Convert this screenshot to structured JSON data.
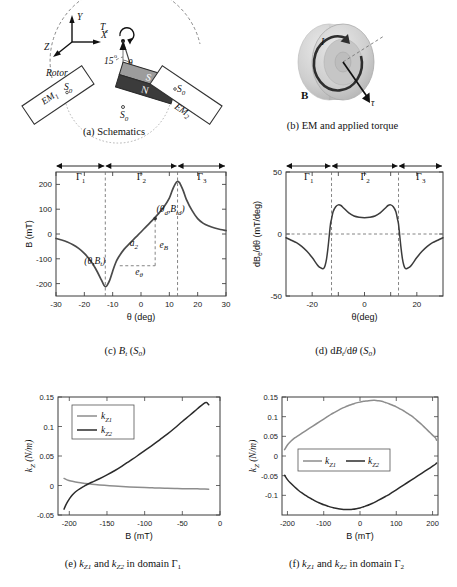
{
  "figure": {
    "panels": [
      {
        "id": "a",
        "caption": "(a) Schematics"
      },
      {
        "id": "b",
        "caption": "(b) EM and applied torque"
      },
      {
        "id": "c",
        "caption_prefix": "(c) ",
        "caption_math": "Bt (S0)"
      },
      {
        "id": "d",
        "caption_prefix": "(d) ",
        "caption_math": "dBt/dθ (S0)"
      },
      {
        "id": "e",
        "caption": "(e) kZ1 and kZ2 in domain Γ1"
      },
      {
        "id": "f",
        "caption": "(f) kZ1 and kZ2 in domain Γ2"
      }
    ]
  },
  "schematic": {
    "axes": {
      "x": "X",
      "y": "Y",
      "z": "Z"
    },
    "torque_label": "Tz",
    "angle_fixed": "15",
    "angle_var": "θ",
    "rotor_label": "Rotor",
    "magnet_pole_top": "S",
    "magnet_pole_bottom": "N",
    "sensor_left": "S0",
    "sensor_right": "S0",
    "sensor_bottom": "S0",
    "em_left": "EM1",
    "em_right": "EM2"
  },
  "em_panel": {
    "current_label": "I",
    "field_label": "B",
    "torque_label": "τ"
  },
  "chart_data": [
    {
      "id": "c",
      "type": "line",
      "title": "",
      "xlabel": "θ (deg)",
      "ylabel": "B (mT)",
      "xlim": [
        -30,
        30
      ],
      "ylim": [
        -250,
        250
      ],
      "xticks": [
        -30,
        -20,
        -10,
        0,
        10,
        20,
        30
      ],
      "yticks": [
        -200,
        -100,
        0,
        100,
        200
      ],
      "grid": false,
      "series": [
        {
          "name": "Bt",
          "x": [
            -30,
            -28,
            -26,
            -24,
            -22,
            -20,
            -18,
            -16,
            -14,
            -13,
            -12.5,
            -12,
            -11,
            -10,
            -9,
            -8,
            -6,
            -4,
            -2,
            0,
            2,
            4,
            6,
            8,
            10,
            11,
            12,
            12.8,
            13.5,
            14,
            15,
            16,
            18,
            20,
            22,
            24,
            26,
            28,
            30
          ],
          "y": [
            -18,
            -24,
            -32,
            -43,
            -58,
            -78,
            -105,
            -140,
            -185,
            -208,
            -212,
            -208,
            -185,
            -150,
            -118,
            -95,
            -62,
            -38,
            -15,
            8,
            32,
            55,
            80,
            108,
            145,
            175,
            200,
            212,
            208,
            198,
            172,
            140,
            95,
            62,
            43,
            32,
            24,
            18,
            14
          ]
        }
      ],
      "annotations": [
        {
          "text": "(θ,Bt)",
          "x": -8,
          "y": -120
        },
        {
          "text": "(θd,Btd)",
          "x": 5.5,
          "y": 72
        },
        {
          "text": "a2"
        },
        {
          "text": "eB"
        },
        {
          "text": "eθ"
        }
      ],
      "domains": [
        {
          "label": "Γ1",
          "from": -30,
          "to": -12.6
        },
        {
          "label": "Γ2",
          "from": -12.6,
          "to": 12.9
        },
        {
          "label": "Γ3",
          "from": 12.9,
          "to": 30
        }
      ]
    },
    {
      "id": "d",
      "type": "line",
      "xlabel": "θ(deg)",
      "ylabel": "dBe/dθ (mT/deg)",
      "xlim": [
        -30,
        30
      ],
      "ylim": [
        -50,
        50
      ],
      "xticks": [
        -20,
        0,
        20
      ],
      "yticks": [
        -50,
        0,
        50
      ],
      "grid": false,
      "zero_line": true,
      "series": [
        {
          "name": "dBe/dθ",
          "x": [
            -30,
            -28,
            -26,
            -24,
            -22,
            -20,
            -18,
            -17,
            -16,
            -15.5,
            -15,
            -14.5,
            -14,
            -13.5,
            -13,
            -12.6,
            -12,
            -11,
            -10,
            -9,
            -8,
            -6,
            -4,
            -2,
            0,
            2,
            4,
            6,
            8,
            9,
            10,
            11,
            12,
            12.6,
            13,
            13.5,
            14,
            14.5,
            15,
            15.5,
            16,
            17,
            18,
            20,
            22,
            24,
            26,
            28,
            30
          ],
          "y": [
            -3,
            -5,
            -7,
            -10,
            -14,
            -19,
            -25,
            -27,
            -28,
            -27.5,
            -25,
            -20,
            -12,
            -2,
            8,
            12,
            18,
            22,
            23.5,
            23,
            21,
            17,
            14.5,
            13.5,
            13.2,
            13.5,
            14.5,
            17,
            21,
            23,
            23.5,
            22,
            18,
            12,
            8,
            -2,
            -12,
            -20,
            -25,
            -27.5,
            -28,
            -27,
            -25,
            -19,
            -14,
            -10,
            -7,
            -5,
            -3
          ]
        }
      ],
      "domains": [
        {
          "label": "Γ1",
          "from": -30,
          "to": -12.6
        },
        {
          "label": "Γ2",
          "from": -12.6,
          "to": 13
        },
        {
          "label": "Γ3",
          "from": 13,
          "to": 30
        }
      ]
    },
    {
      "id": "e",
      "type": "line",
      "xlabel": "B (mT)",
      "ylabel": "kZ (N/m)",
      "xlim": [
        -215,
        0
      ],
      "ylim": [
        -0.05,
        0.15
      ],
      "xticks": [
        -200,
        -150,
        -100,
        -50,
        0
      ],
      "yticks": [
        -0.05,
        0,
        0.05,
        0.1,
        0.15
      ],
      "grid": false,
      "legend": {
        "position": "top-left",
        "entries": [
          "kZ1",
          "kZ2"
        ]
      },
      "series": [
        {
          "name": "kZ1",
          "color": "#8d8d8d",
          "x": [
            -207,
            -203,
            -198,
            -192,
            -185,
            -178,
            -170,
            -160,
            -150,
            -140,
            -130,
            -120,
            -110,
            -100,
            -90,
            -80,
            -70,
            -60,
            -50,
            -40,
            -30,
            -20,
            -15
          ],
          "y": [
            0.012,
            0.0095,
            0.0075,
            0.006,
            0.0045,
            0.0035,
            0.0022,
            0.001,
            0.0,
            -0.001,
            -0.0018,
            -0.0025,
            -0.0031,
            -0.0036,
            -0.004,
            -0.0044,
            -0.0047,
            -0.005,
            -0.0053,
            -0.0055,
            -0.0057,
            -0.006,
            -0.0062
          ]
        },
        {
          "name": "kZ2",
          "color": "#2b2b2b",
          "x": [
            -207,
            -205,
            -202,
            -199,
            -196,
            -192,
            -188,
            -184,
            -180,
            -175,
            -170,
            -160,
            -150,
            -140,
            -130,
            -120,
            -110,
            -100,
            -90,
            -80,
            -70,
            -60,
            -50,
            -40,
            -30,
            -22,
            -18,
            -15
          ],
          "y": [
            -0.04,
            -0.034,
            -0.027,
            -0.021,
            -0.016,
            -0.011,
            -0.0072,
            -0.004,
            -0.001,
            0.0025,
            0.0055,
            0.0115,
            0.018,
            0.025,
            0.033,
            0.0415,
            0.05,
            0.059,
            0.068,
            0.0775,
            0.087,
            0.0975,
            0.1085,
            0.119,
            0.13,
            0.1385,
            0.1405,
            0.137
          ]
        }
      ]
    },
    {
      "id": "f",
      "type": "line",
      "xlabel": "B (mT)",
      "ylabel": "kZ (N/m)",
      "xlim": [
        -215,
        215
      ],
      "ylim": [
        -0.15,
        0.15
      ],
      "xticks": [
        -200,
        -100,
        0,
        100,
        200
      ],
      "yticks": [
        -0.1,
        -0.05,
        0,
        0.05,
        0.1,
        0.15
      ],
      "grid": false,
      "legend": {
        "position": "center",
        "entries": [
          "kZ1",
          "kZ2"
        ]
      },
      "series": [
        {
          "name": "kZ1",
          "color": "#8d8d8d",
          "x": [
            -208,
            -200,
            -190,
            -180,
            -170,
            -160,
            -150,
            -140,
            -130,
            -120,
            -110,
            -100,
            -90,
            -80,
            -70,
            -60,
            -50,
            -40,
            -30,
            -20,
            -10,
            0,
            10,
            20,
            30,
            40,
            50,
            60,
            70,
            80,
            90,
            100,
            110,
            120,
            130,
            140,
            150,
            160,
            170,
            180,
            190,
            200,
            208,
            211
          ],
          "y": [
            0.016,
            0.028,
            0.038,
            0.046,
            0.052,
            0.058,
            0.064,
            0.07,
            0.076,
            0.082,
            0.088,
            0.094,
            0.1,
            0.106,
            0.111,
            0.116,
            0.121,
            0.125,
            0.129,
            0.132,
            0.135,
            0.137,
            0.139,
            0.14,
            0.1412,
            0.1415,
            0.1405,
            0.139,
            0.136,
            0.133,
            0.129,
            0.125,
            0.12,
            0.115,
            0.109,
            0.103,
            0.096,
            0.088,
            0.08,
            0.071,
            0.062,
            0.053,
            0.046,
            0.04
          ]
        },
        {
          "name": "kZ2",
          "color": "#2b2b2b",
          "x": [
            -208,
            -200,
            -190,
            -180,
            -170,
            -160,
            -150,
            -140,
            -130,
            -120,
            -110,
            -100,
            -90,
            -80,
            -70,
            -60,
            -50,
            -40,
            -30,
            -20,
            -10,
            0,
            10,
            20,
            30,
            40,
            50,
            60,
            70,
            80,
            90,
            100,
            110,
            120,
            130,
            140,
            150,
            160,
            170,
            180,
            190,
            200,
            208,
            211
          ],
          "y": [
            -0.049,
            -0.06,
            -0.07,
            -0.079,
            -0.087,
            -0.094,
            -0.1,
            -0.106,
            -0.111,
            -0.116,
            -0.12,
            -0.124,
            -0.127,
            -0.13,
            -0.132,
            -0.134,
            -0.1352,
            -0.1358,
            -0.136,
            -0.1355,
            -0.134,
            -0.132,
            -0.129,
            -0.126,
            -0.122,
            -0.118,
            -0.113,
            -0.108,
            -0.103,
            -0.098,
            -0.092,
            -0.086,
            -0.08,
            -0.074,
            -0.068,
            -0.062,
            -0.056,
            -0.05,
            -0.044,
            -0.038,
            -0.032,
            -0.026,
            -0.021,
            -0.018
          ]
        }
      ]
    }
  ]
}
